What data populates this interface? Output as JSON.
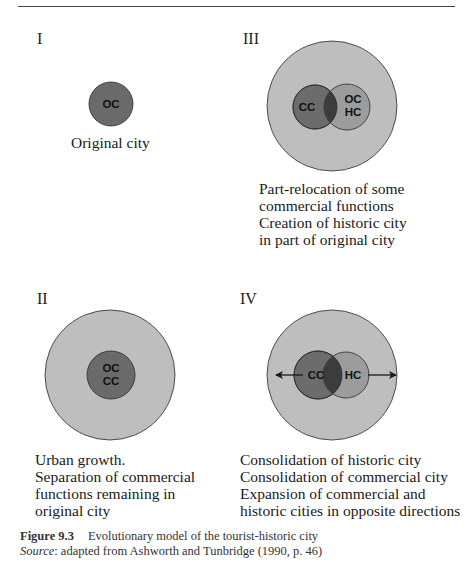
{
  "figure": {
    "number": "Figure 9.3",
    "title": "Evolutionary model of the tourist-historic city",
    "source_label": "Source",
    "source_text": ": adapted from Ashworth and Tunbridge (1990, p. 46)"
  },
  "panels": [
    {
      "id": "I",
      "label": "I",
      "circles": [
        {
          "label": "OC"
        }
      ],
      "description": [
        "Original city"
      ]
    },
    {
      "id": "III",
      "label": "III",
      "circles": [
        {
          "label": "CC"
        },
        {
          "label_line1": "OC",
          "label_line2": "HC"
        }
      ],
      "description": [
        "Part-relocation of some",
        "commercial functions",
        "Creation of historic city",
        "in part of original city"
      ]
    },
    {
      "id": "II",
      "label": "II",
      "circles": [
        {
          "label_line1": "OC",
          "label_line2": "CC"
        }
      ],
      "description": [
        "Urban growth.",
        "Separation of commercial",
        "functions remaining in",
        "original city"
      ]
    },
    {
      "id": "IV",
      "label": "IV",
      "circles": [
        {
          "label": "CC"
        },
        {
          "label": "HC"
        }
      ],
      "description": [
        "Consolidation of historic city",
        "Consolidation of commercial city",
        "Expansion of commercial and",
        "historic cities in opposite directions"
      ]
    }
  ],
  "colors": {
    "outer_city": "#bebebe",
    "commercial_city": "#6c6c6c",
    "historic_city": "#9c9c9c",
    "overlap": "#3c3c3c",
    "original_city": "#6a6a6a",
    "stroke": "#2a2a2a"
  }
}
